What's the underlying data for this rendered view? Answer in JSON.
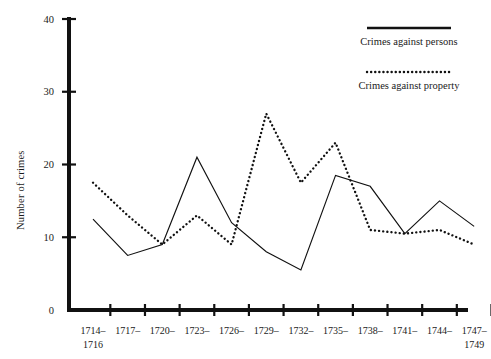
{
  "chart_data": {
    "type": "line",
    "title": "",
    "xlabel": "",
    "ylabel": "Number of crimes",
    "ylim": [
      0,
      40
    ],
    "yticks": [
      0,
      10,
      20,
      30,
      40
    ],
    "ytick_labels": [
      "0",
      "10",
      "20",
      "30",
      "40"
    ],
    "grid": false,
    "legend_position": "top-right",
    "categories": [
      "1714-\n1716",
      "1717-",
      "1720-",
      "1723-",
      "1726-",
      "1729-",
      "1732-",
      "1735-",
      "1738-",
      "1741-",
      "1744-",
      "1747-\n1749"
    ],
    "category_labels": [
      {
        "line1": "1714–",
        "line2": "1716"
      },
      {
        "line1": "1717–",
        "line2": ""
      },
      {
        "line1": "1720–",
        "line2": ""
      },
      {
        "line1": "1723–",
        "line2": ""
      },
      {
        "line1": "1726–",
        "line2": ""
      },
      {
        "line1": "1729–",
        "line2": ""
      },
      {
        "line1": "1732–",
        "line2": ""
      },
      {
        "line1": "1735–",
        "line2": ""
      },
      {
        "line1": "1738–",
        "line2": ""
      },
      {
        "line1": "1741–",
        "line2": ""
      },
      {
        "line1": "1744–",
        "line2": ""
      },
      {
        "line1": "1747–",
        "line2": "1749"
      }
    ],
    "series": [
      {
        "name": "Crimes against persons",
        "style": "solid",
        "color": "#111111",
        "values": [
          12.5,
          7.5,
          9,
          21,
          12,
          8,
          5.5,
          18.5,
          17,
          10.5,
          15,
          11.5
        ]
      },
      {
        "name": "Crimes against property",
        "style": "dotted",
        "color": "#111111",
        "values": [
          17.5,
          13,
          9,
          13,
          9,
          27,
          17.5,
          23,
          11,
          10.5,
          11,
          9
        ]
      }
    ]
  },
  "legend": {
    "entries": [
      {
        "label": "Crimes against persons",
        "style": "solid"
      },
      {
        "label": "Crimes against property",
        "style": "dotted"
      }
    ]
  },
  "axes": {
    "y_axis_title": "Number of crimes"
  }
}
